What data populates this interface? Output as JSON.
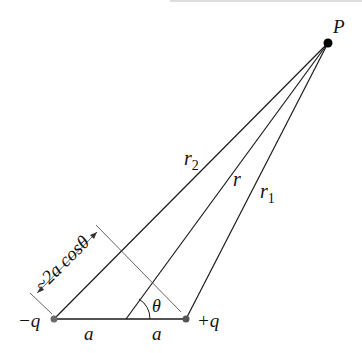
{
  "diagram": {
    "point_label": "P",
    "negative_charge_label": "−q",
    "positive_charge_label": "+q",
    "distance_r2_label": "r",
    "distance_r2_sub": "2",
    "distance_r_label": "r",
    "distance_r1_label": "r",
    "distance_r1_sub": "1",
    "half_separation_left": "a",
    "half_separation_right": "a",
    "angle_label": "θ",
    "path_difference_label": "~2a cosθ",
    "colors": {
      "line": "#1a1a1a",
      "charge_dot": "#6b6b6b",
      "point_dot": "#000000",
      "construction_line": "#555555"
    }
  }
}
